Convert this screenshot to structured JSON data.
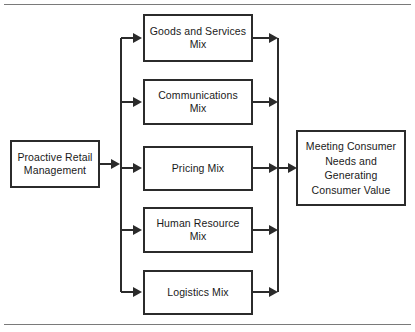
{
  "figure": {
    "type": "flow-diagram",
    "orientation": "left-to-right",
    "rules": {
      "top_rule": "horizontal-rule",
      "bottom_rule": "horizontal-rule"
    },
    "colors": {
      "background": "#ffffff",
      "box_border": "#2b2b2b",
      "connector": "#2b2b2b",
      "text": "#1a1a1a",
      "rule": "#7a7a7a"
    }
  },
  "source": {
    "label": "Proactive Retail\nManagement"
  },
  "mix_nodes": [
    {
      "label": "Goods and Services\nMix"
    },
    {
      "label": "Communications\nMix"
    },
    {
      "label": "Pricing Mix"
    },
    {
      "label": "Human Resource\nMix"
    },
    {
      "label": "Logistics Mix"
    }
  ],
  "outcome": {
    "label": "Meeting Consumer\nNeeds and\nGenerating\nConsumer Value"
  },
  "connectors": {
    "source_to_spine": "arrow-right",
    "spine_to_mix": "arrow-right",
    "mix_to_spine": "arrow-right",
    "spine_to_outcome": "arrow-right"
  }
}
